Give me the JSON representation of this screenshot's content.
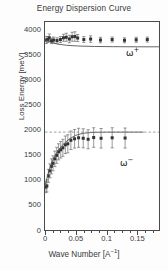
{
  "chart_data": {
    "type": "scatter",
    "title": "Energy Dispersion Curve",
    "xlabel": "Wave Number [A^-1]",
    "ylabel": "Loss Energy [meV]",
    "xlim": [
      0,
      0.185
    ],
    "ylim": [
      0,
      4150
    ],
    "grid": false,
    "legend_position": "inside-right",
    "x_ticks": [
      0,
      0.05,
      0.1,
      0.15
    ],
    "x_tick_labels": [
      "0",
      "0.05",
      "0.1",
      "0.15"
    ],
    "x_minor_step": 0.0125,
    "y_ticks": [
      0,
      500,
      1000,
      1500,
      2000,
      2500,
      3000,
      3500,
      4000
    ],
    "y_tick_labels": [
      "0",
      "500",
      "1000",
      "1500",
      "2000",
      "2500",
      "3000",
      "3500",
      "4000"
    ],
    "y_minor_step": 125,
    "annotations": [
      {
        "name": "omega-plus",
        "text": "ω",
        "superscript": "+",
        "x": 0.135,
        "y": 3280
      },
      {
        "name": "omega-minus",
        "text": "ω",
        "superscript": "−",
        "x": 0.122,
        "y": 1180
      }
    ],
    "series": [
      {
        "name": "omega-plus-data",
        "marker": "square",
        "color": "#333333",
        "points": [
          {
            "x": 0.002,
            "y": 3790,
            "yerr": 70
          },
          {
            "x": 0.0045,
            "y": 3800,
            "yerr": 60
          },
          {
            "x": 0.007,
            "y": 3835,
            "yerr": 75
          },
          {
            "x": 0.0105,
            "y": 3775,
            "yerr": 55
          },
          {
            "x": 0.014,
            "y": 3790,
            "yerr": 60
          },
          {
            "x": 0.0195,
            "y": 3780,
            "yerr": 55
          },
          {
            "x": 0.025,
            "y": 3800,
            "yerr": 60
          },
          {
            "x": 0.03,
            "y": 3835,
            "yerr": 70
          },
          {
            "x": 0.0345,
            "y": 3845,
            "yerr": 80
          },
          {
            "x": 0.0395,
            "y": 3810,
            "yerr": 75
          },
          {
            "x": 0.044,
            "y": 3855,
            "yerr": 90
          },
          {
            "x": 0.0485,
            "y": 3860,
            "yerr": 95
          },
          {
            "x": 0.053,
            "y": 3830,
            "yerr": 70
          },
          {
            "x": 0.063,
            "y": 3800,
            "yerr": 60
          },
          {
            "x": 0.074,
            "y": 3810,
            "yerr": 65
          },
          {
            "x": 0.09,
            "y": 3790,
            "yerr": 55
          },
          {
            "x": 0.109,
            "y": 3800,
            "yerr": 50
          },
          {
            "x": 0.129,
            "y": 3785,
            "yerr": 50
          },
          {
            "x": 0.148,
            "y": 3795,
            "yerr": 50
          },
          {
            "x": 0.166,
            "y": 3800,
            "yerr": 50
          }
        ]
      },
      {
        "name": "omega-minus-data",
        "marker": "square",
        "color": "#333333",
        "points": [
          {
            "x": 0.0015,
            "y": 855,
            "yerr": 110
          },
          {
            "x": 0.003,
            "y": 880,
            "yerr": 120
          },
          {
            "x": 0.0055,
            "y": 1080,
            "yerr": 130
          },
          {
            "x": 0.008,
            "y": 1180,
            "yerr": 140
          },
          {
            "x": 0.0105,
            "y": 1270,
            "yerr": 150
          },
          {
            "x": 0.013,
            "y": 1330,
            "yerr": 150
          },
          {
            "x": 0.016,
            "y": 1420,
            "yerr": 155
          },
          {
            "x": 0.019,
            "y": 1490,
            "yerr": 160
          },
          {
            "x": 0.022,
            "y": 1560,
            "yerr": 160
          },
          {
            "x": 0.0255,
            "y": 1600,
            "yerr": 165
          },
          {
            "x": 0.029,
            "y": 1640,
            "yerr": 170
          },
          {
            "x": 0.033,
            "y": 1700,
            "yerr": 175
          },
          {
            "x": 0.037,
            "y": 1720,
            "yerr": 180
          },
          {
            "x": 0.042,
            "y": 1790,
            "yerr": 185
          },
          {
            "x": 0.048,
            "y": 1820,
            "yerr": 185
          },
          {
            "x": 0.0545,
            "y": 1840,
            "yerr": 190
          },
          {
            "x": 0.062,
            "y": 1830,
            "yerr": 190
          },
          {
            "x": 0.07,
            "y": 1810,
            "yerr": 190
          },
          {
            "x": 0.079,
            "y": 1845,
            "yerr": 195
          },
          {
            "x": 0.091,
            "y": 1830,
            "yerr": 195
          },
          {
            "x": 0.109,
            "y": 1840,
            "yerr": 200
          },
          {
            "x": 0.13,
            "y": 1835,
            "yerr": 200
          }
        ]
      },
      {
        "name": "omega-plus-fit",
        "style": "solid-line",
        "color": "#555555",
        "points": [
          {
            "x": 0.0,
            "y": 3795
          },
          {
            "x": 0.01,
            "y": 3745
          },
          {
            "x": 0.02,
            "y": 3710
          },
          {
            "x": 0.035,
            "y": 3685
          },
          {
            "x": 0.055,
            "y": 3670
          },
          {
            "x": 0.08,
            "y": 3662
          },
          {
            "x": 0.11,
            "y": 3658
          },
          {
            "x": 0.15,
            "y": 3655
          },
          {
            "x": 0.185,
            "y": 3655
          }
        ]
      },
      {
        "name": "omega-minus-fit",
        "style": "solid-line",
        "color": "#555555",
        "points": [
          {
            "x": 0.0,
            "y": 880
          },
          {
            "x": 0.005,
            "y": 1120
          },
          {
            "x": 0.01,
            "y": 1310
          },
          {
            "x": 0.015,
            "y": 1450
          },
          {
            "x": 0.02,
            "y": 1560
          },
          {
            "x": 0.026,
            "y": 1660
          },
          {
            "x": 0.032,
            "y": 1740
          },
          {
            "x": 0.04,
            "y": 1820
          },
          {
            "x": 0.05,
            "y": 1890
          },
          {
            "x": 0.062,
            "y": 1930
          },
          {
            "x": 0.078,
            "y": 1948
          },
          {
            "x": 0.1,
            "y": 1952
          },
          {
            "x": 0.13,
            "y": 1953
          },
          {
            "x": 0.16,
            "y": 1953
          }
        ]
      },
      {
        "name": "omega-minus-asymptote",
        "style": "dashed-line",
        "color": "#888888",
        "y": 1953,
        "x_from": 0.0,
        "x_to": 0.185
      }
    ]
  }
}
